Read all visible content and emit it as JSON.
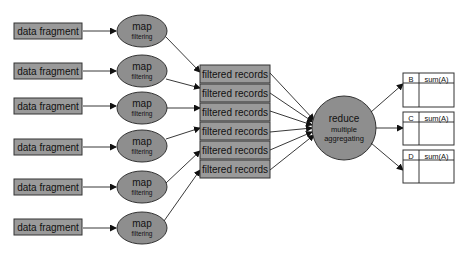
{
  "diagram": {
    "colors": {
      "box_fill": "#9a9a9a",
      "ellipse_fill": "#8e8e8e",
      "stroke": "#333333",
      "background": "#ffffff"
    },
    "data_fragments": [
      {
        "label": "data fragment"
      },
      {
        "label": "data fragment"
      },
      {
        "label": "data fragment"
      },
      {
        "label": "data fragment"
      },
      {
        "label": "data fragment"
      },
      {
        "label": "data fragment"
      }
    ],
    "map_nodes": [
      {
        "title": "map",
        "subtitle": "filtering"
      },
      {
        "title": "map",
        "subtitle": "filtering"
      },
      {
        "title": "map",
        "subtitle": "filtering"
      },
      {
        "title": "map",
        "subtitle": "filtering"
      },
      {
        "title": "map",
        "subtitle": "filtering"
      },
      {
        "title": "map",
        "subtitle": "filtering"
      }
    ],
    "filtered_records": [
      {
        "label": "filtered records"
      },
      {
        "label": "filtered records"
      },
      {
        "label": "filtered records"
      },
      {
        "label": "filtered records"
      },
      {
        "label": "filtered records"
      },
      {
        "label": "filtered records"
      }
    ],
    "reduce_node": {
      "title": "reduce",
      "subtitle_line1": "multiple",
      "subtitle_line2": "aggregating"
    },
    "output_tables": [
      {
        "key": "B",
        "value_header": "sum(A)"
      },
      {
        "key": "C",
        "value_header": "sum(A)"
      },
      {
        "key": "D",
        "value_header": "sum(A)"
      }
    ]
  }
}
